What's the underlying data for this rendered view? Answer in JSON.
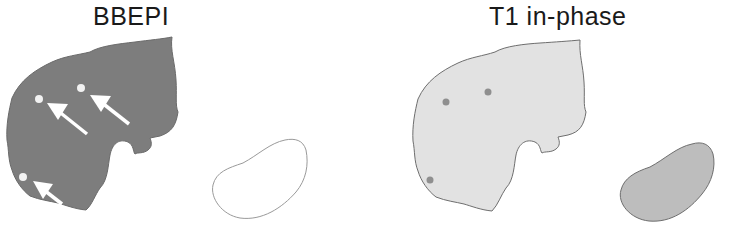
{
  "panels": [
    {
      "title": "BBEPI",
      "liver_fill": "#7d7d7d",
      "lesion_fill": "#f2f2f2",
      "kidney_fill": "#ffffff",
      "kidney_stroke": "#9a9a9a",
      "arrows": 3,
      "lesions": 3
    },
    {
      "title": "T1 in-phase",
      "liver_fill": "#e2e2e2",
      "liver_stroke": "#6e6e6e",
      "lesion_fill": "#8f8f8f",
      "kidney_fill": "#bdbdbd",
      "kidney_stroke": "#6e6e6e",
      "lesions": 3
    }
  ],
  "colors": {
    "background": "#ffffff",
    "arrow": "#ffffff",
    "text": "#1a1a1a"
  }
}
